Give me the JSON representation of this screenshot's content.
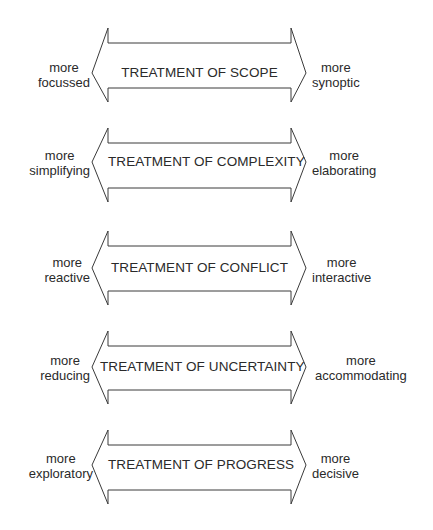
{
  "diagram": {
    "arrows": [
      {
        "title": "TREATMENT OF SCOPE",
        "left_top": "more",
        "left_bottom": "focussed",
        "right_top": "more",
        "right_bottom": "synoptic"
      },
      {
        "title": "TREATMENT OF COMPLEXITY",
        "left_top": "more",
        "left_bottom": "simplifying",
        "right_top": "more",
        "right_bottom": "elaborating"
      },
      {
        "title": "TREATMENT OF CONFLICT",
        "left_top": "more",
        "left_bottom": "reactive",
        "right_top": "more",
        "right_bottom": "interactive"
      },
      {
        "title": "TREATMENT OF UNCERTAINTY",
        "left_top": "more",
        "left_bottom": "reducing",
        "right_top": "more",
        "right_bottom": "accommodating"
      },
      {
        "title": "TREATMENT OF PROGRESS",
        "left_top": "more",
        "left_bottom": "exploratory",
        "right_top": "more",
        "right_bottom": "decisive"
      }
    ],
    "colors": {
      "stroke": "#3a3a3a",
      "text": "#2a2a2a",
      "background": "#ffffff"
    }
  }
}
